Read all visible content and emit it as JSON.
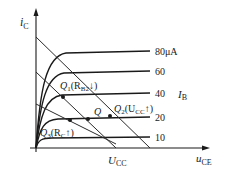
{
  "diagram": {
    "title": "",
    "axes": {
      "y_label": {
        "main": "i",
        "sub": "C"
      },
      "x_label": {
        "main": "u",
        "sub": "CE"
      },
      "ucc_label": {
        "main": "U",
        "sub": "CC"
      }
    },
    "curves_label": {
      "main": "I",
      "sub": "B"
    },
    "curves": [
      {
        "value": "80μA",
        "y": 52
      },
      {
        "value": "60",
        "y": 72
      },
      {
        "value": "40",
        "y": 94
      },
      {
        "value": "20",
        "y": 118
      },
      {
        "value": "10",
        "y": 138
      }
    ],
    "points": {
      "q": {
        "label": "Q"
      },
      "q1": {
        "label": "Q",
        "sub": "1",
        "cond": "(R",
        "cond_sub": "B2",
        "arrow": "↓)"
      },
      "q2": {
        "label": "Q",
        "sub": "2",
        "cond": "(U",
        "cond_sub": "CC",
        "arrow": "↑)"
      },
      "q3": {
        "label": "Q",
        "sub": "3",
        "cond": "(R",
        "cond_sub": "C",
        "arrow": "↑)"
      }
    },
    "colors": {
      "ink": "#1a1a1a",
      "background": "#ffffff"
    }
  }
}
